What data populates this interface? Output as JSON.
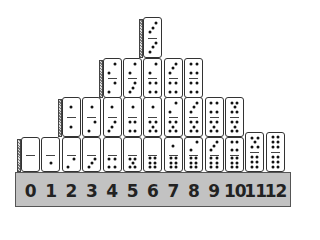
{
  "figure": {
    "base_labels": [
      "0",
      "1",
      "2",
      "3",
      "4",
      "5",
      "6",
      "7",
      "8",
      "9",
      "10",
      "11",
      "12"
    ],
    "columns": [
      {
        "sum": 0,
        "dominoes": [
          [
            0,
            0
          ]
        ]
      },
      {
        "sum": 1,
        "dominoes": [
          [
            0,
            1
          ]
        ]
      },
      {
        "sum": 2,
        "dominoes": [
          [
            0,
            2
          ],
          [
            1,
            1
          ]
        ]
      },
      {
        "sum": 3,
        "dominoes": [
          [
            0,
            3
          ],
          [
            1,
            2
          ]
        ]
      },
      {
        "sum": 4,
        "dominoes": [
          [
            0,
            4
          ],
          [
            1,
            3
          ],
          [
            2,
            2
          ]
        ]
      },
      {
        "sum": 5,
        "dominoes": [
          [
            0,
            5
          ],
          [
            1,
            4
          ],
          [
            2,
            3
          ]
        ]
      },
      {
        "sum": 6,
        "dominoes": [
          [
            0,
            6
          ],
          [
            1,
            5
          ],
          [
            2,
            4
          ],
          [
            3,
            3
          ]
        ]
      },
      {
        "sum": 7,
        "dominoes": [
          [
            1,
            6
          ],
          [
            2,
            5
          ],
          [
            3,
            4
          ]
        ]
      },
      {
        "sum": 8,
        "dominoes": [
          [
            2,
            6
          ],
          [
            3,
            5
          ],
          [
            4,
            4
          ]
        ]
      },
      {
        "sum": 9,
        "dominoes": [
          [
            3,
            6
          ],
          [
            4,
            5
          ]
        ]
      },
      {
        "sum": 10,
        "dominoes": [
          [
            4,
            6
          ],
          [
            5,
            5
          ]
        ]
      },
      {
        "sum": 11,
        "dominoes": [
          [
            5,
            6
          ]
        ]
      },
      {
        "sum": 12,
        "dominoes": [
          [
            6,
            6
          ]
        ]
      }
    ],
    "colors": {
      "base": "#c2c2c2",
      "domino": "#ffffff",
      "ink": "#222222"
    }
  }
}
